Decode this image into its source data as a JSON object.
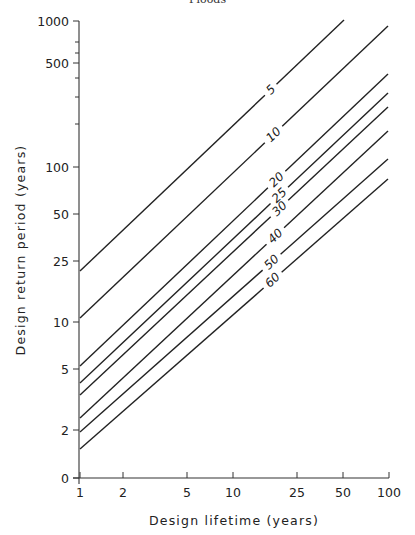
{
  "header": {
    "title": "Floods"
  },
  "chart_data": {
    "type": "line",
    "title": "",
    "xlabel": "Design lifetime (years)",
    "ylabel": "Design return period (years)",
    "x_scale": "log",
    "y_scale": "log",
    "x_ticks": [
      "1",
      "2",
      "5",
      "10",
      "25",
      "50",
      "100"
    ],
    "y_ticks": [
      "0",
      "2",
      "5",
      "10",
      "25",
      "50",
      "100",
      "500",
      "1000"
    ],
    "xlim": [
      1,
      100
    ],
    "ylim": [
      1,
      1000
    ],
    "grid": false,
    "legend": "inline curve labels",
    "series": [
      {
        "name": "5",
        "label": "5",
        "x": [
          1,
          50
        ],
        "values": [
          20,
          1000
        ]
      },
      {
        "name": "10",
        "label": "10",
        "x": [
          1,
          100
        ],
        "values": [
          10.5,
          950
        ]
      },
      {
        "name": "20",
        "label": "20",
        "x": [
          1,
          100
        ],
        "values": [
          5.3,
          480
        ]
      },
      {
        "name": "25",
        "label": "25",
        "x": [
          1,
          100
        ],
        "values": [
          4.4,
          390
        ]
      },
      {
        "name": "30",
        "label": "30",
        "x": [
          1,
          100
        ],
        "values": [
          3.6,
          320
        ]
      },
      {
        "name": "40",
        "label": "40",
        "x": [
          1,
          100
        ],
        "values": [
          2.6,
          210
        ]
      },
      {
        "name": "50",
        "label": "50",
        "x": [
          1,
          100
        ],
        "values": [
          2.0,
          140
        ]
      },
      {
        "name": "60",
        "label": "60",
        "x": [
          1,
          100
        ],
        "values": [
          1.6,
          100
        ]
      }
    ]
  },
  "layout": {
    "axis_x": 79,
    "axis_y": 478,
    "x_ticks_px": [
      80,
      123,
      187,
      233,
      297,
      343,
      389
    ],
    "y_ticks_px": [
      478,
      430,
      369,
      322,
      261,
      214,
      167,
      63,
      21
    ],
    "y_minor_ticks_px": [
      42,
      53,
      78,
      97,
      124
    ],
    "curves_px": [
      {
        "x1": 80,
        "y1": 271,
        "x2": 344,
        "y2": 20,
        "lx": 271,
        "ly": 90
      },
      {
        "x1": 80,
        "y1": 318,
        "x2": 388,
        "y2": 26,
        "lx": 273,
        "ly": 134
      },
      {
        "x1": 80,
        "y1": 366,
        "x2": 388,
        "y2": 74,
        "lx": 277,
        "ly": 180
      },
      {
        "x1": 80,
        "y1": 383,
        "x2": 388,
        "y2": 93,
        "lx": 278,
        "ly": 194
      },
      {
        "x1": 80,
        "y1": 395,
        "x2": 388,
        "y2": 107,
        "lx": 279,
        "ly": 208
      },
      {
        "x1": 80,
        "y1": 418,
        "x2": 388,
        "y2": 131,
        "lx": 279,
        "ly": 240
      },
      {
        "x1": 80,
        "y1": 432,
        "x2": 388,
        "y2": 159,
        "lx": 275,
        "ly": 266
      },
      {
        "x1": 80,
        "y1": 449,
        "x2": 388,
        "y2": 179,
        "lx": 276,
        "ly": 284
      }
    ]
  }
}
